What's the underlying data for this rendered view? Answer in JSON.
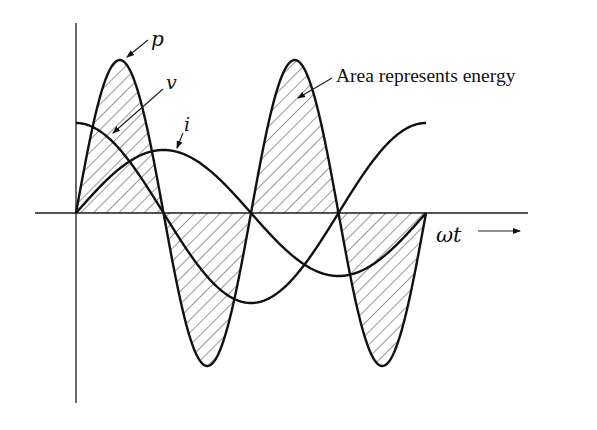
{
  "diagram": {
    "labels": {
      "p": "p",
      "v": "v",
      "i": "i",
      "area_note": "Area represents energy",
      "x_axis": "ωt"
    },
    "axes": {
      "origin": [
        76,
        213
      ],
      "x_axis_start": 35,
      "x_axis_end": 528,
      "y_axis_top": 23,
      "y_axis_bottom": 403
    },
    "waveforms": {
      "x_start": 76,
      "x_end": 426,
      "period_px": 350,
      "v": {
        "type": "cos",
        "amplitude_px": 90,
        "phase": 0
      },
      "i": {
        "type": "sin",
        "amplitude_px": 63,
        "phase": 0
      },
      "p": {
        "type": "sin2",
        "amplitude_px": 153,
        "hatched": true
      }
    },
    "colors": {
      "line": "#111111",
      "hatch": "#444444",
      "background": "#ffffff"
    }
  },
  "chart_data": {
    "type": "line",
    "title": "",
    "xlabel": "ωt",
    "ylabel": "",
    "series": [
      {
        "name": "v",
        "form": "V·cos(ωt)",
        "relative_amplitude": 0.59
      },
      {
        "name": "i",
        "form": "I·sin(ωt)",
        "relative_amplitude": 0.41
      },
      {
        "name": "p",
        "form": "v·i ∝ sin(2ωt)",
        "relative_amplitude": 1.0,
        "shaded": true
      }
    ],
    "x_range_periods": [
      0,
      1
    ],
    "annotations": [
      "p",
      "v",
      "i",
      "Area represents energy",
      "ωt →"
    ],
    "grid": false
  }
}
